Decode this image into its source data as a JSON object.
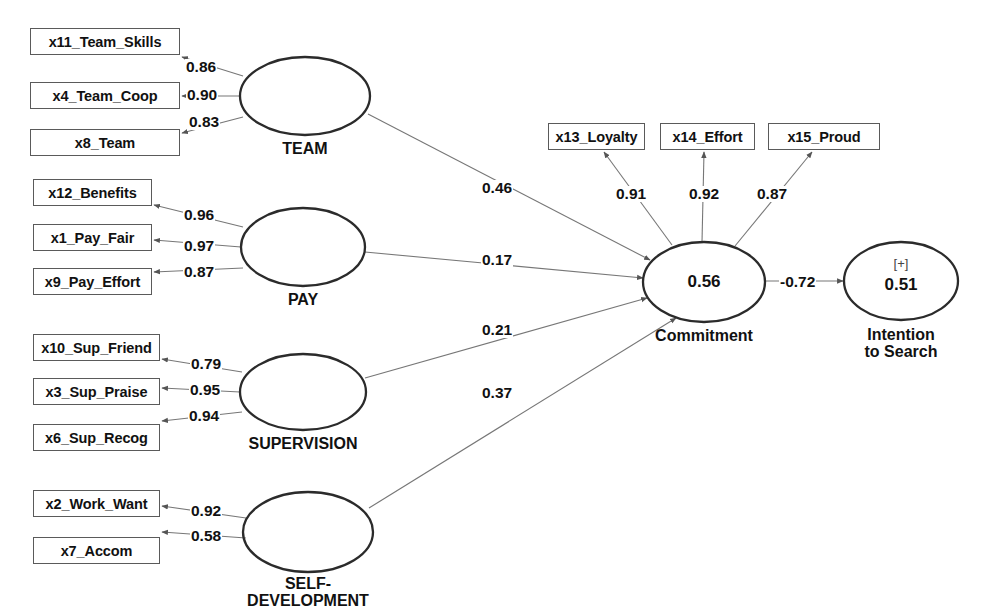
{
  "diagram": {
    "type": "sem-path-diagram",
    "colors": {
      "box_border": "#5a5a5a",
      "ellipse_border": "#2b2b2b",
      "arrow": "#555555",
      "text": "#111111",
      "background": "#ffffff"
    }
  },
  "latent_nodes": [
    {
      "id": "team",
      "label": "TEAM",
      "value": "",
      "sign": "",
      "cx": 305,
      "cy": 96,
      "rx": 65,
      "ry": 39
    },
    {
      "id": "pay",
      "label": "PAY",
      "value": "",
      "sign": "",
      "cx": 303,
      "cy": 247,
      "rx": 62,
      "ry": 39
    },
    {
      "id": "supervision",
      "label": "SUPERVISION",
      "value": "",
      "sign": "",
      "cx": 303,
      "cy": 392,
      "rx": 63,
      "ry": 38
    },
    {
      "id": "self_development",
      "label": "SELF-\nDEVELOPMENT",
      "value": "",
      "sign": "",
      "cx": 308,
      "cy": 532,
      "rx": 65,
      "ry": 40
    },
    {
      "id": "commitment",
      "label": "Commitment",
      "value": "0.56",
      "sign": "",
      "cx": 704,
      "cy": 282,
      "rx": 61,
      "ry": 40
    },
    {
      "id": "intention",
      "label": "Intention\nto Search",
      "value": "0.51",
      "sign": "[+]",
      "cx": 901,
      "cy": 281,
      "rx": 57,
      "ry": 39
    }
  ],
  "indicators": [
    {
      "id": "x11",
      "label": "x11_Team_Skills",
      "x": 30,
      "y": 28,
      "w": 150,
      "h": 27
    },
    {
      "id": "x4",
      "label": "x4_Team_Coop",
      "x": 30,
      "y": 82,
      "w": 150,
      "h": 27
    },
    {
      "id": "x8",
      "label": "x8_Team",
      "x": 30,
      "y": 129,
      "w": 150,
      "h": 27
    },
    {
      "id": "x12",
      "label": "x12_Benefits",
      "x": 33,
      "y": 179,
      "w": 119,
      "h": 27
    },
    {
      "id": "x1",
      "label": "x1_Pay_Fair",
      "x": 33,
      "y": 224,
      "w": 119,
      "h": 27
    },
    {
      "id": "x9",
      "label": "x9_Pay_Effort",
      "x": 33,
      "y": 268,
      "w": 119,
      "h": 27
    },
    {
      "id": "x10",
      "label": "x10_Sup_Friend",
      "x": 33,
      "y": 334,
      "w": 127,
      "h": 27
    },
    {
      "id": "x3",
      "label": "x3_Sup_Praise",
      "x": 33,
      "y": 378,
      "w": 127,
      "h": 27
    },
    {
      "id": "x6",
      "label": "x6_Sup_Recog",
      "x": 33,
      "y": 424,
      "w": 127,
      "h": 27
    },
    {
      "id": "x2",
      "label": "x2_Work_Want",
      "x": 33,
      "y": 490,
      "w": 127,
      "h": 27
    },
    {
      "id": "x7",
      "label": "x7_Accom",
      "x": 33,
      "y": 537,
      "w": 127,
      "h": 27
    },
    {
      "id": "x13",
      "label": "x13_Loyalty",
      "x": 548,
      "y": 123,
      "w": 97,
      "h": 27
    },
    {
      "id": "x14",
      "label": "x14_Effort",
      "x": 660,
      "y": 123,
      "w": 95,
      "h": 27
    },
    {
      "id": "x15",
      "label": "x15_Proud",
      "x": 768,
      "y": 123,
      "w": 112,
      "h": 27
    }
  ],
  "measurement_paths": [
    {
      "from": "team",
      "to": "x11",
      "value": "0.86",
      "lx": 185,
      "ly": 59
    },
    {
      "from": "team",
      "to": "x4",
      "value": "0.90",
      "lx": 186,
      "ly": 87
    },
    {
      "from": "team",
      "to": "x8",
      "value": "0.83",
      "lx": 188,
      "ly": 114
    },
    {
      "from": "pay",
      "to": "x12",
      "value": "0.96",
      "lx": 183,
      "ly": 207
    },
    {
      "from": "pay",
      "to": "x1",
      "value": "0.97",
      "lx": 183,
      "ly": 238
    },
    {
      "from": "pay",
      "to": "x9",
      "value": "0.87",
      "lx": 183,
      "ly": 264
    },
    {
      "from": "supervision",
      "to": "x10",
      "value": "0.79",
      "lx": 190,
      "ly": 356
    },
    {
      "from": "supervision",
      "to": "x3",
      "value": "0.95",
      "lx": 189,
      "ly": 382
    },
    {
      "from": "supervision",
      "to": "x6",
      "value": "0.94",
      "lx": 188,
      "ly": 408
    },
    {
      "from": "self_development",
      "to": "x2",
      "value": "0.92",
      "lx": 190,
      "ly": 503
    },
    {
      "from": "self_development",
      "to": "x7",
      "value": "0.58",
      "lx": 190,
      "ly": 528
    },
    {
      "from": "commitment",
      "to": "x13",
      "value": "0.91",
      "lx": 615,
      "ly": 186
    },
    {
      "from": "commitment",
      "to": "x14",
      "value": "0.92",
      "lx": 688,
      "ly": 186
    },
    {
      "from": "commitment",
      "to": "x15",
      "value": "0.87",
      "lx": 756,
      "ly": 186
    }
  ],
  "structural_paths": [
    {
      "from": "team",
      "to": "commitment",
      "value": "0.46",
      "lx": 481,
      "ly": 180
    },
    {
      "from": "pay",
      "to": "commitment",
      "value": "0.17",
      "lx": 481,
      "ly": 252
    },
    {
      "from": "supervision",
      "to": "commitment",
      "value": "0.21",
      "lx": 481,
      "ly": 322
    },
    {
      "from": "self_development",
      "to": "commitment",
      "value": "0.37",
      "lx": 481,
      "ly": 385
    },
    {
      "from": "commitment",
      "to": "intention",
      "value": "-0.72",
      "lx": 779,
      "ly": 274
    }
  ]
}
